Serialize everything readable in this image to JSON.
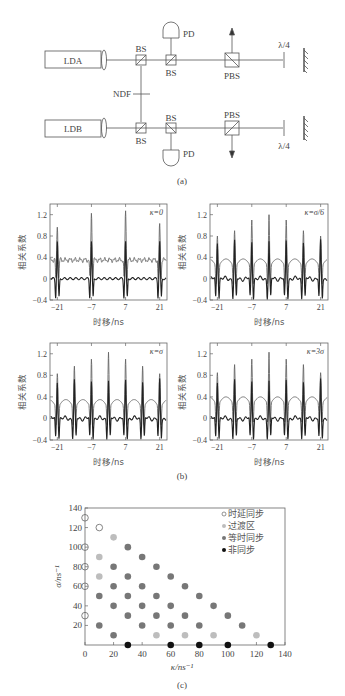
{
  "figure_a": {
    "caption": "(a)",
    "labels": {
      "lda": "LDA",
      "ldb": "LDB",
      "bs": "BS",
      "pbs": "PBS",
      "pd": "PD",
      "ndf": "NDF",
      "qwp": "λ/4"
    }
  },
  "figure_b": {
    "caption": "(b)",
    "ylabel": "相关系数",
    "xlabel": "时移/ns",
    "yticks": [
      "1.2",
      "0.8",
      "0.4",
      "0",
      "−0.4"
    ],
    "xticks": [
      "−21",
      "−7",
      "7",
      "21"
    ],
    "panels": [
      {
        "kappa_label": "κ=0"
      },
      {
        "kappa_label": "κ=σ/6"
      },
      {
        "kappa_label": "κ=σ"
      },
      {
        "kappa_label": "κ=3σ"
      }
    ]
  },
  "figure_c": {
    "caption": "(c)",
    "xlabel": "κ/ns⁻¹",
    "ylabel": "σ/ns⁻¹",
    "xticks": [
      "0",
      "20",
      "40",
      "60",
      "80",
      "100",
      "120",
      "140"
    ],
    "yticks": [
      "20",
      "40",
      "60",
      "80",
      "100",
      "120",
      "140"
    ],
    "legend": [
      "时延同步",
      "过渡区",
      "等时同步",
      "非同步"
    ]
  },
  "chart_data": [
    {
      "type": "line",
      "title": "κ=0",
      "xlabel": "时移/ns",
      "ylabel": "相关系数",
      "xlim": [
        -24,
        24
      ],
      "ylim": [
        -0.4,
        1.4
      ],
      "x_ticks": [
        -21,
        -7,
        7,
        21
      ],
      "y_ticks": [
        -0.4,
        0,
        0.4,
        0.8,
        1.2
      ],
      "series": [
        {
          "name": "upper (gray)",
          "baseline": 0.35,
          "peaks": [
            {
              "x": -21,
              "y": 1.0
            },
            {
              "x": -7,
              "y": 1.25
            },
            {
              "x": 7,
              "y": 1.25
            },
            {
              "x": 21,
              "y": 1.0
            }
          ]
        },
        {
          "name": "lower (black)",
          "baseline": 0.0,
          "peaks": [
            {
              "x": -21,
              "y": 0.75
            },
            {
              "x": -7,
              "y": 0.75
            },
            {
              "x": 7,
              "y": 0.75
            },
            {
              "x": 21,
              "y": 0.75
            }
          ],
          "minima": -0.35
        }
      ]
    },
    {
      "type": "line",
      "title": "κ=σ/6",
      "xlabel": "时移/ns",
      "ylabel": "相关系数",
      "xlim": [
        -24,
        24
      ],
      "ylim": [
        -0.4,
        1.4
      ],
      "series": [
        {
          "name": "upper (gray)",
          "baseline": 0.35,
          "peaks": [
            {
              "x": -21,
              "y": 0.95
            },
            {
              "x": -14,
              "y": 1.05
            },
            {
              "x": -7,
              "y": 1.25
            },
            {
              "x": 0,
              "y": 1.35
            },
            {
              "x": 7,
              "y": 1.25
            },
            {
              "x": 14,
              "y": 1.05
            },
            {
              "x": 21,
              "y": 0.95
            }
          ]
        },
        {
          "name": "lower (black)",
          "baseline": 0.0,
          "minima": -0.35
        }
      ]
    },
    {
      "type": "line",
      "title": "κ=σ",
      "xlabel": "时移/ns",
      "ylabel": "相关系数",
      "xlim": [
        -24,
        24
      ],
      "ylim": [
        -0.4,
        1.4
      ],
      "series": [
        {
          "name": "upper (gray)",
          "baseline": 0.33,
          "peaks": [
            {
              "x": -21,
              "y": 0.98
            },
            {
              "x": -14,
              "y": 1.12
            },
            {
              "x": -7,
              "y": 1.25
            },
            {
              "x": 0,
              "y": 1.38
            },
            {
              "x": 7,
              "y": 1.25
            },
            {
              "x": 14,
              "y": 1.12
            },
            {
              "x": 21,
              "y": 0.98
            }
          ]
        },
        {
          "name": "lower (black)",
          "baseline": 0.0,
          "minima": -0.35
        }
      ]
    },
    {
      "type": "line",
      "title": "κ=3σ",
      "xlabel": "时移/ns",
      "ylabel": "相关系数",
      "xlim": [
        -24,
        24
      ],
      "ylim": [
        -0.4,
        1.4
      ],
      "series": [
        {
          "name": "upper (gray)",
          "baseline": 0.38,
          "peaks": [
            {
              "x": -21,
              "y": 1.0
            },
            {
              "x": -14,
              "y": 1.15
            },
            {
              "x": -7,
              "y": 1.25
            },
            {
              "x": 0,
              "y": 1.38
            },
            {
              "x": 7,
              "y": 1.25
            },
            {
              "x": 14,
              "y": 1.15
            },
            {
              "x": 21,
              "y": 1.0
            }
          ]
        },
        {
          "name": "lower (black)",
          "baseline": 0.0,
          "minima": -0.35
        }
      ]
    },
    {
      "type": "scatter",
      "title": "",
      "xlabel": "κ/ns⁻¹",
      "ylabel": "σ/ns⁻¹",
      "xlim": [
        0,
        140
      ],
      "ylim": [
        0,
        140
      ],
      "legend_position": "upper right",
      "series": [
        {
          "name": "时延同步",
          "marker": "open-circle",
          "color": "#666666",
          "points": [
            [
              0,
              130
            ],
            [
              10,
              120
            ],
            [
              0,
              100
            ],
            [
              0,
              80
            ],
            [
              0,
              60
            ],
            [
              0,
              30
            ]
          ]
        },
        {
          "name": "过渡区",
          "marker": "filled-circle",
          "color": "#bdbdbd",
          "points": [
            [
              20,
              110
            ],
            [
              10,
              90
            ],
            [
              10,
              70
            ],
            [
              50,
              10
            ],
            [
              70,
              10
            ],
            [
              90,
              10
            ],
            [
              120,
              10
            ]
          ]
        },
        {
          "name": "等时同步",
          "marker": "filled-circle",
          "color": "#777777",
          "points": [
            [
              30,
              100
            ],
            [
              40,
              90
            ],
            [
              20,
              80
            ],
            [
              50,
              80
            ],
            [
              30,
              70
            ],
            [
              60,
              70
            ],
            [
              20,
              60
            ],
            [
              40,
              60
            ],
            [
              70,
              60
            ],
            [
              10,
              50
            ],
            [
              30,
              50
            ],
            [
              50,
              50
            ],
            [
              80,
              50
            ],
            [
              20,
              40
            ],
            [
              40,
              40
            ],
            [
              60,
              40
            ],
            [
              90,
              40
            ],
            [
              30,
              30
            ],
            [
              50,
              30
            ],
            [
              70,
              30
            ],
            [
              100,
              30
            ],
            [
              10,
              20
            ],
            [
              40,
              20
            ],
            [
              60,
              20
            ],
            [
              80,
              20
            ],
            [
              110,
              20
            ],
            [
              20,
              10
            ]
          ]
        },
        {
          "name": "非同步",
          "marker": "filled-circle",
          "color": "#111111",
          "points": [
            [
              30,
              0
            ],
            [
              60,
              0
            ],
            [
              80,
              0
            ],
            [
              100,
              0
            ],
            [
              130,
              0
            ]
          ]
        }
      ]
    }
  ]
}
